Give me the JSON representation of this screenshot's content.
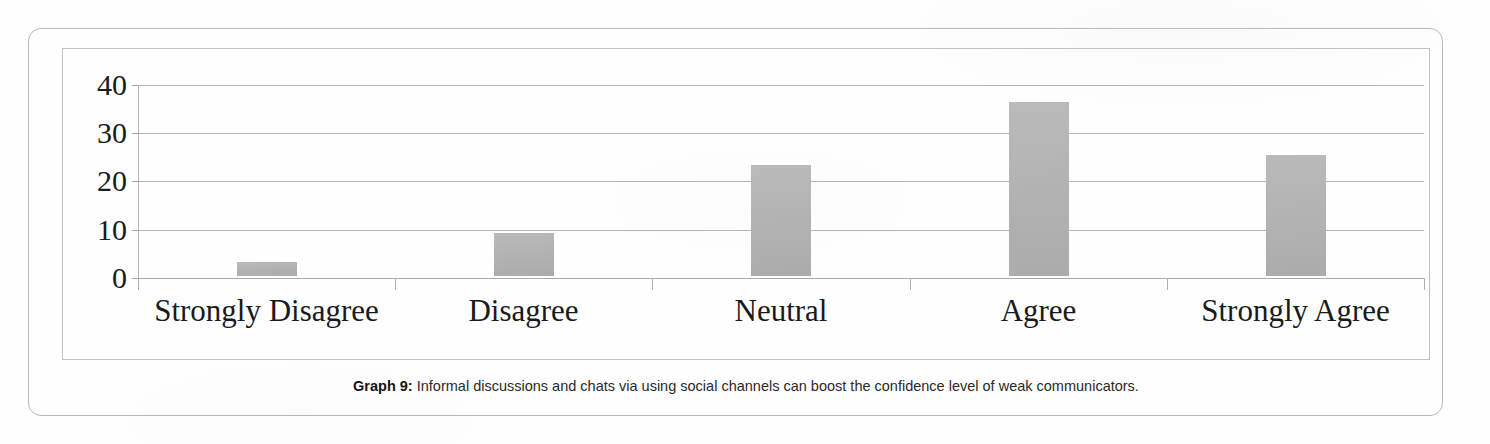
{
  "figure": {
    "caption_label": "Graph 9:",
    "caption_text": " Informal discussions and chats via using social channels can boost the confidence level of weak communicators."
  },
  "colors": {
    "bar_fill": "#b2b2b2",
    "gridline": "#b5b5b5",
    "frame": "#c2c2c2",
    "outer_frame": "#b9b9b9",
    "text": "#1a1a1a",
    "page_background": "#fefefe"
  },
  "chart_data": {
    "type": "bar",
    "title": "",
    "subtitle": "",
    "xlabel": "",
    "ylabel": "",
    "categories": [
      "Strongly Disagree",
      "Disagree",
      "Neutral",
      "Agree",
      "Strongly Agree"
    ],
    "values": [
      3,
      9,
      23,
      36,
      25
    ],
    "series": [
      {
        "name": "Responses",
        "values": [
          3,
          9,
          23,
          36,
          25
        ]
      }
    ],
    "ylim": [
      0,
      40
    ],
    "y_ticks": [
      0,
      10,
      20,
      30,
      40
    ],
    "y_tick_labels": [
      "0",
      "10",
      "20",
      "30",
      "40"
    ],
    "grid": true,
    "grid_axis": "y",
    "legend": false,
    "legend_position": "none",
    "bar_orientation": "vertical",
    "annotations": []
  }
}
